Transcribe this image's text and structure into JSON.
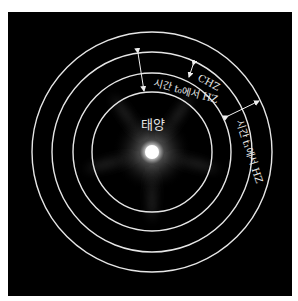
{
  "diagram": {
    "labels": {
      "sun": "태양",
      "chz": "CHZ",
      "hz_t0": "시간 t₀에서 HZ",
      "hz_t1": "시간 t₁에서 HZ"
    },
    "rings": {
      "center": [
        152,
        152
      ],
      "radii": [
        60,
        79,
        100,
        120
      ],
      "color": "#e6e6e6"
    },
    "background": "#000000"
  }
}
